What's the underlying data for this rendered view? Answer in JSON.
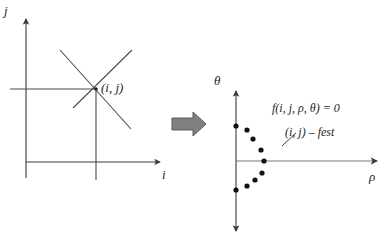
{
  "figure": {
    "background_color": "#ffffff",
    "line_color": "#3a3a3a",
    "text_color": "#1d1d1d",
    "arrow_fill_color": "#808080",
    "arrow_stroke_color": "#4a4a4a",
    "dot_color": "#111111"
  },
  "left_panel": {
    "name": "image-space-plot",
    "axis_labels": {
      "y": "j",
      "x": "i"
    },
    "point_label": "(i, j)",
    "point": {
      "i": 96,
      "j": 89
    },
    "lines_through_point": 4,
    "description": "Four lines crossing at the point (i, j) in image space"
  },
  "transform_arrow": {
    "name": "transform-arrow",
    "direction": "right",
    "label": ""
  },
  "right_panel": {
    "name": "parameter-space-plot",
    "axis_labels": {
      "y": "θ",
      "x": "ρ"
    },
    "annotations": [
      {
        "id": "curve-equation",
        "text": "f(i, j, ρ, θ) = 0"
      },
      {
        "id": "point-family",
        "text": "(i, j) – fest"
      }
    ],
    "leader_line": {
      "from": [
        296,
        135
      ],
      "to": [
        283,
        147
      ]
    }
  },
  "chart_data": {
    "type": "scatter",
    "xlabel": "ρ",
    "ylabel": "θ",
    "grid": false,
    "legend": null,
    "axis_origin_px": [
      236,
      161
    ],
    "xlim_px": [
      236,
      378
    ],
    "ylim_px": [
      90,
      232
    ],
    "annotations": [
      "f(i, j, ρ, θ) = 0",
      "(i, j) – fest"
    ],
    "points_px": [
      [
        236,
        126
      ],
      [
        247,
        130
      ],
      [
        253,
        139
      ],
      [
        261,
        150
      ],
      [
        264,
        161
      ],
      [
        262,
        173
      ],
      [
        255,
        180
      ],
      [
        247,
        186
      ],
      [
        236,
        190
      ]
    ],
    "series": [
      {
        "name": "sinusoid samples",
        "x": [
          0,
          11,
          17,
          25,
          28,
          26,
          19,
          11,
          0
        ],
        "y": [
          35,
          31,
          22,
          11,
          0,
          -12,
          -19,
          -25,
          -29
        ]
      }
    ]
  }
}
